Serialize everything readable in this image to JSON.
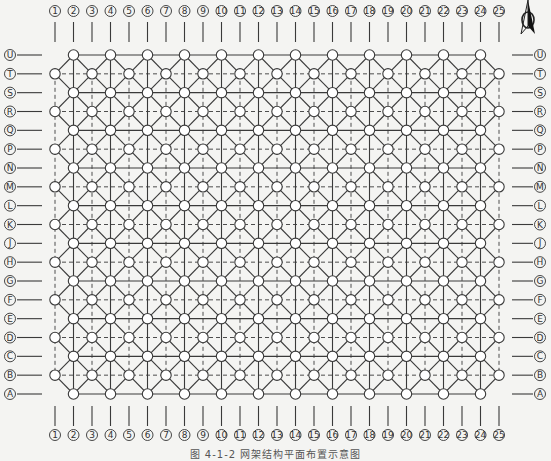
{
  "figure": {
    "caption": "图 4-1-2  网架结构平面布置示意图",
    "north_arrow": "north-arrow-icon"
  },
  "grid": {
    "columns": [
      "1",
      "2",
      "3",
      "4",
      "5",
      "6",
      "7",
      "8",
      "9",
      "10",
      "11",
      "12",
      "13",
      "14",
      "15",
      "16",
      "17",
      "18",
      "19",
      "20",
      "21",
      "22",
      "23",
      "24",
      "25"
    ],
    "rows_top_to_bottom": [
      "U",
      "T",
      "S",
      "R",
      "Q",
      "P",
      "N",
      "M",
      "L",
      "K",
      "J",
      "H",
      "G",
      "F",
      "E",
      "D",
      "C",
      "B",
      "A"
    ],
    "node_pattern": "staggered: rows U,S,Q,N,L,J,G,E,C,A have nodes on even columns; rows T,R,P,M,K,H,F,D,B have nodes on odd columns",
    "line_styles": {
      "even_lines": "solid",
      "odd_lines": "dashed",
      "diagonals": "solid"
    },
    "colors": {
      "line": "#3a3a3a",
      "node_fill": "#ffffff",
      "background": "#f4f4f2"
    }
  }
}
